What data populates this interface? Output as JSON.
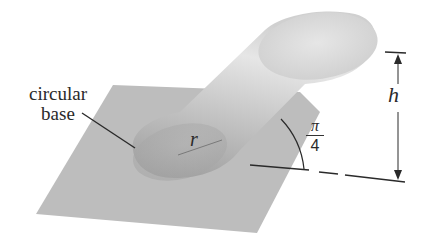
{
  "diagram": {
    "type": "oblique-cylinder",
    "labels": {
      "base_line1": "circular",
      "base_line2": "base",
      "radius": "r",
      "height": "h",
      "angle_numerator": "π",
      "angle_denominator": "4"
    },
    "angle": "π/4",
    "colors": {
      "background": "#ffffff",
      "plane": "#bcbcbc",
      "cylinder_light": "#e2e2e2",
      "cylinder_dark": "#9d9d9d",
      "top_face": "#dadada",
      "ink": "#2a2a2a"
    }
  }
}
